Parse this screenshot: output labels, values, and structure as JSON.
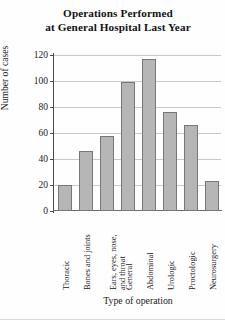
{
  "chart_data": {
    "type": "bar",
    "title": "Operations Performed at General Hospital Last Year",
    "title_lines": [
      "Operations Performed",
      "at General Hospital Last Year"
    ],
    "xlabel": "Type of operation",
    "ylabel": "Number of cases",
    "categories": [
      "Thoracic",
      "Bones and joints",
      "Ears, eyes, nose, and throat",
      "General",
      "Abdominal",
      "Urologic",
      "Proctologic",
      "Neurosurgery"
    ],
    "category_lines": [
      [
        "Thoracic"
      ],
      [
        "Bones and joints"
      ],
      [
        "Ears, eyes, nose,",
        "and throat"
      ],
      [
        "General"
      ],
      [
        "Abdominal"
      ],
      [
        "Urologic"
      ],
      [
        "Proctologic"
      ],
      [
        "Neurosurgery"
      ]
    ],
    "values": [
      20,
      46,
      58,
      99,
      117,
      76,
      66,
      23
    ],
    "ylim": [
      0,
      120
    ],
    "yticks": [
      0,
      20,
      40,
      60,
      80,
      100,
      120
    ],
    "ytick_labels": [
      "0",
      "20",
      "40",
      "60",
      "80",
      "100",
      "120"
    ],
    "grid": true,
    "legend": false,
    "bar_color": "#b6b6b6",
    "bar_border_color": "#777777",
    "grid_color": "#c9c9c9",
    "axis_color": "#4a4a4a"
  }
}
